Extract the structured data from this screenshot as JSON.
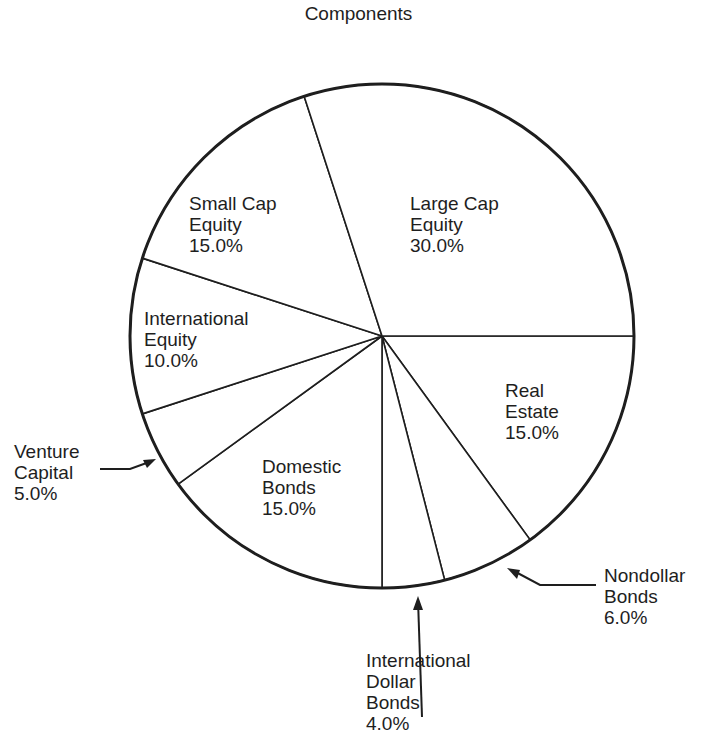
{
  "chart_data": {
    "type": "pie",
    "title": "Components",
    "start_angle_deg": 0,
    "direction": "clockwise",
    "slices": [
      {
        "name": "Real Estate",
        "value": 15.0,
        "label": "15.0%"
      },
      {
        "name": "Nondollar Bonds",
        "value": 6.0,
        "label": "6.0%"
      },
      {
        "name": "International Dollar Bonds",
        "value": 4.0,
        "label": "4.0%"
      },
      {
        "name": "Domestic Bonds",
        "value": 15.0,
        "label": "15.0%"
      },
      {
        "name": "Venture Capital",
        "value": 5.0,
        "label": "5.0%"
      },
      {
        "name": "International Equity",
        "value": 10.0,
        "label": "10.0%"
      },
      {
        "name": "Small Cap Equity",
        "value": 15.0,
        "label": "15.0%"
      },
      {
        "name": "Large Cap Equity",
        "value": 30.0,
        "label": "30.0%"
      }
    ],
    "legend": "none",
    "colors": {
      "fill": "#ffffff",
      "stroke": "#1e1e1e"
    }
  },
  "labels": {
    "large_cap": "Large Cap\nEquity\n30.0%",
    "small_cap": "Small Cap\nEquity\n15.0%",
    "intl_equity": "International\nEquity\n10.0%",
    "venture": "Venture\nCapital\n5.0%",
    "domestic": "Domestic\nBonds\n15.0%",
    "intl_dollar": "International\nDollar\nBonds\n4.0%",
    "nondollar": "Nondollar\nBonds\n6.0%",
    "real_estate": "Real\nEstate\n15.0%"
  }
}
